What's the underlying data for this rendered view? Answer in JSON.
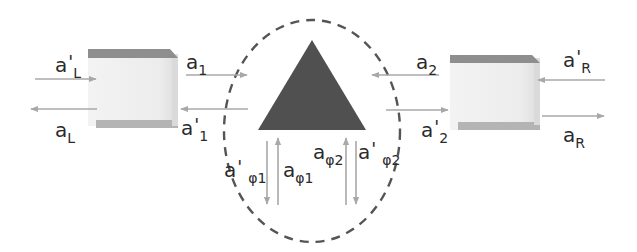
{
  "diagram": {
    "type": "scattering-junction-schematic",
    "colors": {
      "triangle": "#505050",
      "circle_dash": "#555555",
      "arrows": "#a8a8a8",
      "box_fill": "#eeeeee",
      "box_edge": "#9a9a9a",
      "box_side": "#d6d6d6",
      "text": "#2a2a2a"
    },
    "labels": {
      "aL_prime": {
        "base": "a",
        "prime": "'",
        "sub": "L"
      },
      "aL": {
        "base": "a",
        "sub": "L"
      },
      "a1": {
        "base": "a",
        "sub": "1"
      },
      "a1_prime": {
        "base": "a",
        "prime": "'",
        "sub": "1"
      },
      "a2": {
        "base": "a",
        "sub": "2"
      },
      "a2_prime": {
        "base": "a",
        "prime": "'",
        "sub": "2"
      },
      "aR_prime": {
        "base": "a",
        "prime": "'",
        "sub": "R"
      },
      "aR": {
        "base": "a",
        "sub": "R"
      },
      "aphi1_prime": {
        "base": "a",
        "prime": "'",
        "sub": "φ1"
      },
      "aphi1": {
        "base": "a",
        "sub": "φ1"
      },
      "aphi2": {
        "base": "a",
        "sub": "φ2"
      },
      "aphi2_prime": {
        "base": "a",
        "prime": "'",
        "sub": "φ2"
      }
    },
    "elements": [
      {
        "id": "left-box",
        "kind": "waveguide-block"
      },
      {
        "id": "right-box",
        "kind": "waveguide-block"
      },
      {
        "id": "triangle",
        "kind": "scatterer"
      },
      {
        "id": "dashed-circle",
        "kind": "boundary"
      }
    ]
  }
}
